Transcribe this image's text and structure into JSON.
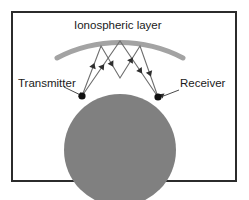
{
  "figure": {
    "title": "Ionospheric layer",
    "width": 249,
    "height": 200,
    "background": "#ffffff",
    "frame_color": "#2b2b2b"
  },
  "labels": {
    "ionosphere": "Ionospheric layer",
    "transmitter": "Transmitter",
    "receiver": "Receiver"
  },
  "colors": {
    "earth_fill": "#808080",
    "ionosphere_arc": "#a3a3a3",
    "ray": "#6e6e6e",
    "node": "#111111",
    "text": "#1a1a1a",
    "frame": "#2b2b2b"
  },
  "geometry": {
    "earth": {
      "cx": 120,
      "cy": 150,
      "r": 56
    },
    "ionosphere_arc": {
      "cx": 120,
      "cy": 176,
      "r": 136,
      "stroke_width": 5
    },
    "transmitter_node": {
      "x": 82,
      "y": 96,
      "r": 3.6
    },
    "receiver_node": {
      "x": 158,
      "y": 97,
      "r": 3.6
    },
    "ground_bounce": {
      "x": 120,
      "y": 78
    },
    "sky_bounce_left": {
      "x": 101,
      "y": 46
    },
    "sky_bounce_mid": {
      "x": 120,
      "y": 41
    },
    "sky_bounce_right": {
      "x": 140,
      "y": 46
    },
    "leader_transmitter": {
      "x1": 66,
      "y1": 88,
      "x2": 79,
      "y2": 94
    },
    "leader_receiver": {
      "x1": 178,
      "y1": 90,
      "x2": 163,
      "y2": 96
    }
  },
  "ray_paths": [
    {
      "name": "path-a",
      "points": [
        [
          82,
          96
        ],
        [
          101,
          46
        ],
        [
          120,
          78
        ],
        [
          140,
          46
        ],
        [
          158,
          97
        ]
      ]
    },
    {
      "name": "path-b",
      "points": [
        [
          82,
          96
        ],
        [
          120,
          41
        ],
        [
          158,
          97
        ]
      ]
    }
  ]
}
